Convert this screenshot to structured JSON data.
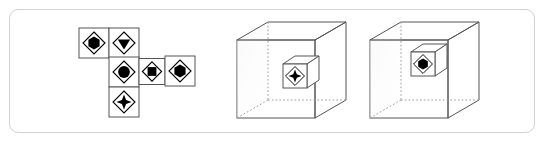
{
  "figure": {
    "kind": "cube-net-folding-puzzle",
    "background_color": "#ffffff",
    "frame_color": "#d2d2d2",
    "line_color": "#555555",
    "hidden_line_color": "#9a9a9a",
    "symbol_stroke_color": "#000000",
    "symbol_fill_color": "#000000"
  },
  "net": {
    "label": "cube-net",
    "description": "Unfolded cube net arranged in a cross-like layout",
    "cell_size": 30,
    "cells": [
      {
        "id": "net-cell-1",
        "row": 0,
        "col": 0,
        "x": 79,
        "y": 28,
        "size": 30,
        "symbol": "hexagon-in-diamond",
        "symbol_name": "filled-hexagon"
      },
      {
        "id": "net-cell-2",
        "row": 0,
        "col": 1,
        "x": 109,
        "y": 28,
        "size": 30,
        "symbol": "triangle-down-in-diamond",
        "symbol_name": "filled-triangle-down"
      },
      {
        "id": "net-cell-3",
        "row": 1,
        "col": 1,
        "x": 109,
        "y": 57,
        "size": 30,
        "symbol": "circle-in-diamond",
        "symbol_name": "filled-circle"
      },
      {
        "id": "net-cell-4",
        "row": 1,
        "col": 2,
        "x": 139,
        "y": 57,
        "size": 26,
        "symbol": "square-in-diamond",
        "symbol_name": "filled-square"
      },
      {
        "id": "net-cell-5",
        "row": 1,
        "col": 3,
        "x": 165,
        "y": 56,
        "size": 30,
        "symbol": "hexagon-in-diamond",
        "symbol_name": "filled-hexagon"
      },
      {
        "id": "net-cell-6",
        "row": 2,
        "col": 1,
        "x": 109,
        "y": 87,
        "size": 30,
        "symbol": "star4-in-diamond",
        "symbol_name": "filled-four-point-star"
      }
    ]
  },
  "cubes": [
    {
      "id": "cube-option-a",
      "label": "cube-with-star-face",
      "outer_cube": {
        "front_left_x": 237,
        "front_top_y": 40,
        "front_size": 78,
        "depth_dx": 31,
        "depth_dy": -18
      },
      "inner_cube": {
        "face_x": 283,
        "face_y": 64,
        "face_size": 24,
        "depth_dx": 12,
        "depth_dy": -8,
        "symbol": "star4-in-diamond",
        "symbol_name": "filled-four-point-star"
      }
    },
    {
      "id": "cube-option-b",
      "label": "cube-with-circle-face",
      "outer_cube": {
        "front_left_x": 370,
        "front_top_y": 40,
        "front_size": 78,
        "depth_dx": 31,
        "depth_dy": -18
      },
      "inner_cube": {
        "face_x": 411,
        "face_y": 52,
        "face_size": 24,
        "depth_dx": 12,
        "depth_dy": -8,
        "symbol": "hexagon-in-diamond",
        "symbol_name": "filled-hexagon"
      }
    }
  ]
}
